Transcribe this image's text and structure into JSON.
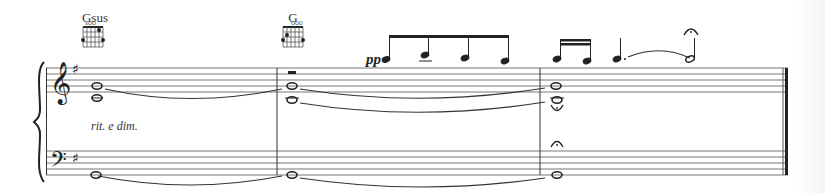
{
  "score": {
    "chords": [
      {
        "name": "Gsus",
        "x": 95
      },
      {
        "name": "G",
        "x": 293
      }
    ],
    "dynamics": {
      "text": "pp",
      "x": 368,
      "y": 76
    },
    "expression": {
      "text": "rit. e dim.",
      "x": 91,
      "y": 131
    },
    "key_signature": "G major (1 sharp)",
    "clefs": {
      "treble": "treble-clef",
      "bass": "bass-clef"
    },
    "measures": [
      {
        "index": 1,
        "chord": "Gsus",
        "treble": [
          "whole G4",
          "whole C4 (tied)"
        ],
        "bass": [
          "whole G2 (tied)"
        ]
      },
      {
        "index": 2,
        "chord": "G",
        "treble": [
          "whole rest (upper voice)",
          "eighths B5 C6 B5 A5",
          "whole G4",
          "whole B3/C4 (tied)"
        ],
        "bass": [
          "whole G2 (tied)"
        ]
      },
      {
        "index": 3,
        "treble": [
          "sixteenths B5 A5",
          "dotted quarter A5 tied to half A5 with fermata",
          "whole G4",
          "whole B3 with fermata"
        ],
        "bass": [
          "whole G2",
          "fermata"
        ]
      }
    ],
    "colors": {
      "ink": "#222222",
      "staff": "#555555",
      "paper": "#ffffff"
    }
  }
}
